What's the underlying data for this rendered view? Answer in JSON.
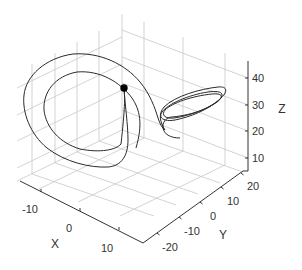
{
  "chart_data": {
    "type": "line3d",
    "title": "",
    "xlabel": "X",
    "ylabel": "Y",
    "zlabel": "Z",
    "x_ticks": [
      "-10",
      "0",
      "10"
    ],
    "y_ticks": [
      "-20",
      "-10",
      "0",
      "10",
      "20"
    ],
    "z_ticks": [
      "10",
      "20",
      "30",
      "40"
    ],
    "xlim": [
      -18,
      16
    ],
    "ylim": [
      -25,
      25
    ],
    "zlim": [
      5,
      47
    ],
    "grid": true,
    "line_color": "#2a2a2a",
    "marker": {
      "color": "#000000",
      "label": "current point"
    },
    "series": [
      {
        "name": "trajectory",
        "description": "two large loops around left lobe, several tight loops around right lobe"
      }
    ]
  },
  "axes": {
    "x": {
      "label": "X",
      "ticks": [
        {
          "label": "-10",
          "px": [
            41,
            192
          ],
          "lpx": [
            30,
            213
          ]
        },
        {
          "label": "0",
          "px": [
            80,
            211
          ],
          "lpx": [
            69,
            232
          ]
        },
        {
          "label": "10",
          "px": [
            119,
            230
          ],
          "lpx": [
            107,
            252
          ]
        }
      ],
      "label_px": [
        55,
        248
      ]
    },
    "y": {
      "label": "Y",
      "ticks": [
        {
          "label": "-20",
          "px": [
            157,
            233
          ],
          "lpx": [
            170,
            251
          ]
        },
        {
          "label": "-10",
          "px": [
            179,
            217
          ],
          "lpx": [
            192,
            235
          ]
        },
        {
          "label": "0",
          "px": [
            200,
            202
          ],
          "lpx": [
            213,
            220
          ]
        },
        {
          "label": "10",
          "px": [
            221,
            187
          ],
          "lpx": [
            233,
            205
          ]
        },
        {
          "label": "20",
          "px": [
            241,
            173
          ],
          "lpx": [
            253,
            190
          ]
        }
      ],
      "label_px": [
        223,
        239
      ]
    },
    "z": {
      "label": "Z",
      "ticks": [
        {
          "label": "10",
          "px": [
            248,
            158
          ],
          "lpx": [
            258,
            162
          ]
        },
        {
          "label": "20",
          "px": [
            248,
            131
          ],
          "lpx": [
            258,
            135
          ]
        },
        {
          "label": "30",
          "px": [
            248,
            105
          ],
          "lpx": [
            258,
            109
          ]
        },
        {
          "label": "40",
          "px": [
            248,
            78
          ],
          "lpx": [
            258,
            82
          ]
        }
      ],
      "label_px": [
        282,
        113
      ]
    }
  }
}
